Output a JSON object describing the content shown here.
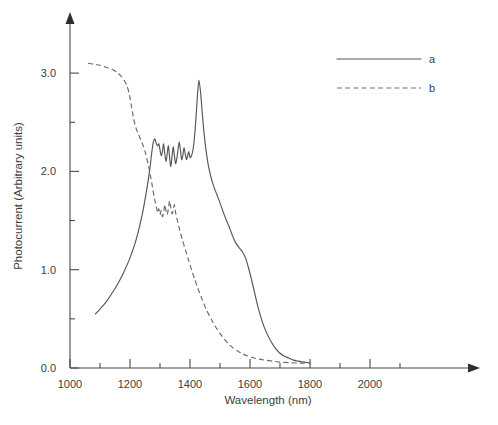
{
  "chart_data": {
    "type": "line",
    "title": "",
    "xlabel": "Wavelength (nm)",
    "ylabel": "Photocurrent (Arbitrary units)",
    "xlim": [
      1000,
      2100
    ],
    "ylim": [
      0.0,
      3.4
    ],
    "xticks": [
      1000,
      1100,
      1200,
      1300,
      1400,
      1500,
      1600,
      1700,
      1800,
      1900,
      2000,
      2100
    ],
    "xtick_labels": [
      "1000",
      "",
      "1200",
      "",
      "1400",
      "",
      "1600",
      "",
      "1800",
      "",
      "2000",
      ""
    ],
    "xtick_labels_major": [
      "1000",
      "1200",
      "1400",
      "1600",
      "1800",
      "2000"
    ],
    "yticks": [
      0.0,
      0.5,
      1.0,
      1.5,
      2.0,
      2.5,
      3.0
    ],
    "ytick_labels": [
      "0.0",
      "",
      "1.0",
      "",
      "2.0",
      "",
      "3.0"
    ],
    "ytick_labels_major": [
      "0.0",
      "1.0",
      "2.0",
      "3.0"
    ],
    "grid": false,
    "legend_position": "top-right",
    "series": [
      {
        "name": "a",
        "label": "a",
        "style": "solid",
        "color": "#555555",
        "x": [
          1085,
          1100,
          1120,
          1140,
          1160,
          1180,
          1200,
          1220,
          1240,
          1255,
          1265,
          1272,
          1278,
          1283,
          1288,
          1292,
          1296,
          1300,
          1304,
          1308,
          1312,
          1316,
          1320,
          1324,
          1328,
          1332,
          1336,
          1340,
          1344,
          1348,
          1352,
          1356,
          1360,
          1364,
          1368,
          1372,
          1376,
          1380,
          1384,
          1388,
          1392,
          1396,
          1400,
          1405,
          1410,
          1415,
          1420,
          1425,
          1430,
          1436,
          1442,
          1450,
          1460,
          1470,
          1480,
          1490,
          1500,
          1515,
          1530,
          1545,
          1555,
          1565,
          1575,
          1585,
          1595,
          1605,
          1615,
          1625,
          1640,
          1655,
          1670,
          1685,
          1700,
          1715,
          1730,
          1745,
          1760,
          1780,
          1800
        ],
        "y": [
          0.55,
          0.6,
          0.67,
          0.76,
          0.86,
          0.98,
          1.12,
          1.3,
          1.55,
          1.8,
          2.0,
          2.18,
          2.3,
          2.33,
          2.28,
          2.26,
          2.28,
          2.22,
          2.16,
          2.2,
          2.28,
          2.18,
          2.1,
          2.18,
          2.26,
          2.14,
          2.05,
          2.15,
          2.25,
          2.16,
          2.08,
          2.13,
          2.22,
          2.3,
          2.22,
          2.12,
          2.16,
          2.24,
          2.18,
          2.12,
          2.16,
          2.2,
          2.14,
          2.16,
          2.22,
          2.35,
          2.55,
          2.78,
          2.93,
          2.78,
          2.55,
          2.3,
          2.08,
          1.94,
          1.84,
          1.76,
          1.68,
          1.55,
          1.44,
          1.32,
          1.26,
          1.22,
          1.18,
          1.12,
          1.02,
          0.9,
          0.77,
          0.64,
          0.48,
          0.36,
          0.27,
          0.2,
          0.15,
          0.12,
          0.1,
          0.08,
          0.07,
          0.06,
          0.05
        ]
      },
      {
        "name": "b",
        "label": "b",
        "style": "dashed",
        "color": "#6a6a6a",
        "x": [
          1060,
          1080,
          1100,
          1120,
          1140,
          1155,
          1170,
          1180,
          1190,
          1198,
          1205,
          1212,
          1220,
          1228,
          1236,
          1244,
          1252,
          1260,
          1268,
          1276,
          1282,
          1288,
          1292,
          1296,
          1300,
          1304,
          1308,
          1312,
          1316,
          1320,
          1324,
          1328,
          1332,
          1336,
          1340,
          1344,
          1348,
          1352,
          1358,
          1366,
          1375,
          1385,
          1395,
          1405,
          1415,
          1425,
          1440,
          1455,
          1470,
          1485,
          1500,
          1515,
          1530,
          1545,
          1560,
          1575,
          1590,
          1610,
          1630,
          1650,
          1675,
          1700,
          1730,
          1760,
          1790
        ],
        "y": [
          3.1,
          3.09,
          3.08,
          3.06,
          3.04,
          3.01,
          2.97,
          2.93,
          2.87,
          2.78,
          2.66,
          2.54,
          2.44,
          2.38,
          2.32,
          2.26,
          2.18,
          2.08,
          1.96,
          1.82,
          1.72,
          1.64,
          1.58,
          1.62,
          1.56,
          1.6,
          1.54,
          1.58,
          1.66,
          1.6,
          1.56,
          1.62,
          1.7,
          1.63,
          1.57,
          1.6,
          1.66,
          1.58,
          1.5,
          1.4,
          1.3,
          1.2,
          1.1,
          1.0,
          0.91,
          0.82,
          0.7,
          0.59,
          0.5,
          0.42,
          0.35,
          0.29,
          0.24,
          0.2,
          0.17,
          0.145,
          0.125,
          0.105,
          0.09,
          0.08,
          0.07,
          0.06,
          0.055,
          0.05,
          0.05
        ]
      }
    ]
  },
  "legend": {
    "entries": [
      {
        "label": "a",
        "style": "solid"
      },
      {
        "label": "b",
        "style": "dashed"
      }
    ]
  }
}
